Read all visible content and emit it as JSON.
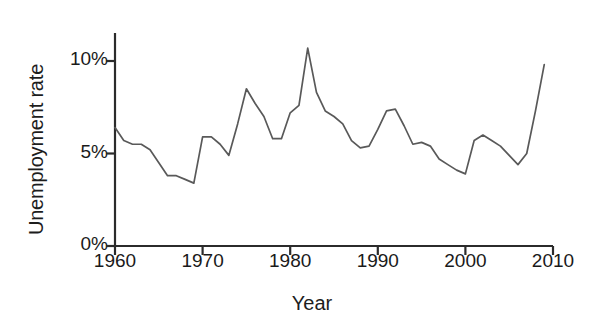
{
  "chart_data": {
    "type": "line",
    "title": "",
    "xlabel": "Year",
    "ylabel": "Unemployment rate",
    "xlim": [
      1960,
      2010
    ],
    "ylim": [
      0,
      11.6
    ],
    "grid": false,
    "legend": false,
    "legend_position": "none",
    "xticks": [
      1960,
      1970,
      1980,
      1990,
      2000,
      2010
    ],
    "xtick_labels": [
      "1960",
      "1970",
      "1980",
      "1990",
      "2000",
      "2010"
    ],
    "yticks": [
      0,
      5,
      10
    ],
    "ytick_labels": [
      "0%",
      "5%",
      "10%"
    ],
    "line_color": "#595959",
    "x": [
      1960,
      1961,
      1962,
      1963,
      1964,
      1965,
      1966,
      1967,
      1968,
      1969,
      1970,
      1971,
      1972,
      1973,
      1974,
      1975,
      1976,
      1977,
      1978,
      1979,
      1980,
      1981,
      1982,
      1983,
      1984,
      1985,
      1986,
      1987,
      1988,
      1989,
      1990,
      1991,
      1992,
      1993,
      1994,
      1995,
      1996,
      1997,
      1998,
      1999,
      2000,
      2001,
      2002,
      2003,
      2004,
      2005,
      2006,
      2007,
      2008,
      2009
    ],
    "values": [
      6.4,
      5.7,
      5.5,
      5.5,
      5.2,
      4.5,
      3.8,
      3.8,
      3.6,
      3.4,
      5.9,
      5.9,
      5.5,
      4.9,
      6.6,
      8.5,
      7.7,
      7.0,
      5.8,
      5.8,
      7.2,
      7.6,
      10.7,
      8.3,
      7.3,
      7.0,
      6.6,
      5.7,
      5.3,
      5.4,
      6.3,
      7.3,
      7.4,
      6.5,
      5.5,
      5.6,
      5.4,
      4.7,
      4.4,
      4.1,
      3.9,
      5.7,
      6.0,
      5.7,
      5.4,
      4.9,
      4.4,
      5.0,
      7.3,
      9.8
    ],
    "series_name": "Unemployment rate",
    "units": "percent",
    "annotations": []
  },
  "axis": {
    "y_title": "Unemployment rate",
    "x_title": "Year"
  }
}
